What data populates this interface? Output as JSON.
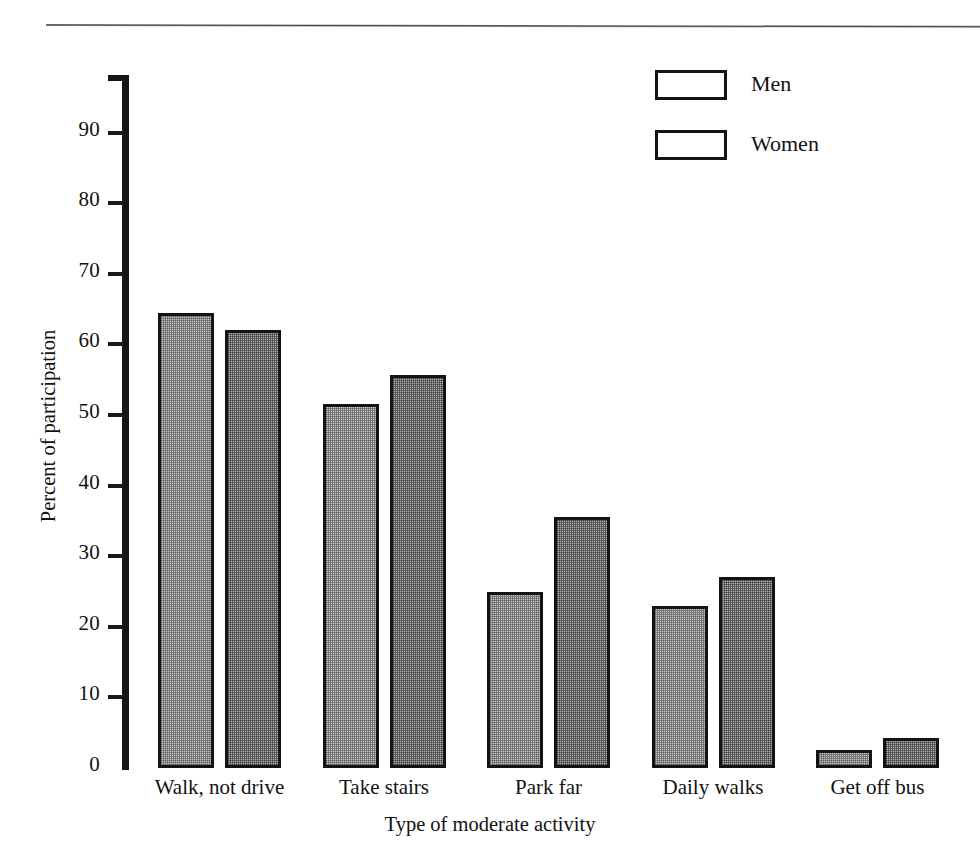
{
  "chart_data": {
    "type": "bar",
    "title": "",
    "xlabel": "Type of moderate activity",
    "ylabel": "Percent of participation",
    "categories": [
      "Walk, not drive",
      "Take stairs",
      "Park far",
      "Daily walks",
      "Get off bus"
    ],
    "series": [
      {
        "name": "Men",
        "values": [
          64.5,
          51.5,
          25.0,
          23.0,
          2.5
        ]
      },
      {
        "name": "Women",
        "values": [
          62.0,
          55.7,
          35.5,
          27.0,
          4.2
        ]
      }
    ],
    "ylim": [
      0,
      100
    ],
    "yticks": [
      0,
      10,
      20,
      30,
      40,
      50,
      60,
      70,
      80,
      90
    ],
    "ytick_labels": [
      "0",
      "10",
      "20",
      "30",
      "40",
      "50",
      "60",
      "70",
      "80",
      "90"
    ],
    "grid": false,
    "legend_position": "top-right",
    "colors": {
      "men_fill": "#c9c9c9",
      "women_fill": "#b4b4b4",
      "bar_outline": "#141414",
      "axis": "#151515",
      "text": "#121212",
      "background": "#ffffff"
    }
  },
  "legend": {
    "entries": [
      {
        "label": "Men"
      },
      {
        "label": "Women"
      }
    ]
  },
  "axes": {
    "y_title": "Percent of participation",
    "x_title": "Type of moderate activity"
  }
}
